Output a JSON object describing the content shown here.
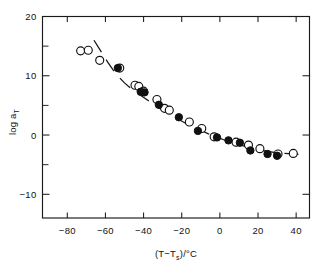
{
  "figure": {
    "name": "log-aT-vs-T-minus-Ts-plot",
    "background_color": "#ffffff",
    "ink_color": "#111111"
  },
  "chart_data": {
    "type": "scatter",
    "title": "",
    "subtitle": "",
    "xlabel": "(T−Tₛ)/°C",
    "ylabel": "log aₜ",
    "xlim": [
      -93,
      47
    ],
    "ylim": [
      -14,
      20
    ],
    "xticks": [
      -80,
      -60,
      -40,
      -20,
      0,
      20,
      40
    ],
    "xticklabels": [
      "−80",
      "−60",
      "−40",
      "−20",
      "0",
      "20",
      "40"
    ],
    "yticks": [
      -10,
      0,
      10,
      20
    ],
    "yticklabels": [
      "−10",
      "0",
      "10",
      "20"
    ],
    "y_minor_ticks": [
      -5,
      5,
      15
    ],
    "grid": false,
    "legend": null,
    "legend_position": "none",
    "axis_style": "box-frame-inward-ticks",
    "series": [
      {
        "name": "open-circles",
        "marker": "open-circle",
        "marker_size": 4.0,
        "points": [
          {
            "x": -73.0,
            "y": 14.2
          },
          {
            "x": -69.0,
            "y": 14.3
          },
          {
            "x": -63.0,
            "y": 12.6
          },
          {
            "x": -52.5,
            "y": 11.3
          },
          {
            "x": -44.5,
            "y": 8.4
          },
          {
            "x": -42.5,
            "y": 8.2
          },
          {
            "x": -40.0,
            "y": 7.4
          },
          {
            "x": -33.0,
            "y": 6.0
          },
          {
            "x": -29.0,
            "y": 4.5
          },
          {
            "x": -26.5,
            "y": 4.2
          },
          {
            "x": -16.0,
            "y": 2.2
          },
          {
            "x": -9.5,
            "y": 1.1
          },
          {
            "x": -3.0,
            "y": -0.3
          },
          {
            "x": 8.5,
            "y": -1.2
          },
          {
            "x": 15.0,
            "y": -1.7
          },
          {
            "x": 21.0,
            "y": -2.3
          },
          {
            "x": 30.5,
            "y": -3.2
          },
          {
            "x": 38.5,
            "y": -3.1
          }
        ]
      },
      {
        "name": "filled-circles",
        "marker": "filled-circle",
        "marker_size": 3.7,
        "points": [
          {
            "x": -53.5,
            "y": 11.3
          },
          {
            "x": -41.5,
            "y": 7.3
          },
          {
            "x": -39.5,
            "y": 7.2
          },
          {
            "x": -32.0,
            "y": 5.1
          },
          {
            "x": -21.5,
            "y": 3.0
          },
          {
            "x": -11.5,
            "y": 0.7
          },
          {
            "x": -1.5,
            "y": -0.4
          },
          {
            "x": 4.5,
            "y": -0.9
          },
          {
            "x": 10.5,
            "y": -1.3
          },
          {
            "x": 16.0,
            "y": -2.6
          },
          {
            "x": 25.0,
            "y": -3.2
          },
          {
            "x": 30.0,
            "y": -3.5
          }
        ]
      }
    ],
    "fit_curve": {
      "name": "wlf-dashed-curve",
      "style": "dashed",
      "dash_pattern": "14 9",
      "points": [
        {
          "x": -66.0,
          "y": 16.0
        },
        {
          "x": -62.5,
          "y": 14.2
        },
        {
          "x": -59.0,
          "y": 12.4
        },
        {
          "x": -56.0,
          "y": 11.0
        },
        {
          "x": -53.0,
          "y": 9.8
        },
        {
          "x": -50.0,
          "y": 8.8
        },
        {
          "x": -46.0,
          "y": 7.7
        },
        {
          "x": -42.0,
          "y": 6.8
        },
        {
          "x": -38.0,
          "y": 5.9
        },
        {
          "x": -34.0,
          "y": 5.0
        },
        {
          "x": -30.0,
          "y": 4.2
        },
        {
          "x": -26.0,
          "y": 3.4
        },
        {
          "x": -22.0,
          "y": 2.7
        },
        {
          "x": -18.0,
          "y": 2.0
        },
        {
          "x": -14.0,
          "y": 1.4
        },
        {
          "x": -10.0,
          "y": 0.8
        },
        {
          "x": -6.0,
          "y": 0.2
        },
        {
          "x": -2.0,
          "y": -0.3
        },
        {
          "x": 2.0,
          "y": -0.8
        },
        {
          "x": 6.0,
          "y": -1.2
        },
        {
          "x": 10.0,
          "y": -1.6
        },
        {
          "x": 14.0,
          "y": -2.0
        },
        {
          "x": 18.0,
          "y": -2.3
        },
        {
          "x": 22.0,
          "y": -2.6
        },
        {
          "x": 26.0,
          "y": -2.8
        },
        {
          "x": 30.0,
          "y": -3.0
        },
        {
          "x": 34.0,
          "y": -3.1
        },
        {
          "x": 38.0,
          "y": -3.2
        },
        {
          "x": 42.0,
          "y": -3.3
        }
      ]
    }
  }
}
